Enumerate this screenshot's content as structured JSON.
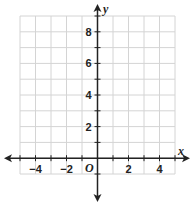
{
  "chart_data": {
    "type": "coordinate-grid",
    "title": "",
    "xlabel": "x",
    "ylabel": "y",
    "origin_label": "O",
    "xlim": [
      -5,
      5
    ],
    "ylim": [
      -1,
      9
    ],
    "grid": true,
    "grid_step": 1,
    "x_tick_labels": [
      "−4",
      "−2",
      "2",
      "4"
    ],
    "x_tick_values": [
      -4,
      -2,
      2,
      4
    ],
    "y_tick_labels": [
      "2",
      "4",
      "6",
      "8"
    ],
    "y_tick_values": [
      2,
      4,
      6,
      8
    ],
    "axis_arrows": {
      "x": "both",
      "y": "both"
    },
    "series": []
  },
  "colors": {
    "grid": "#d4d4d4",
    "axis": "#222222",
    "background": "#ffffff"
  }
}
